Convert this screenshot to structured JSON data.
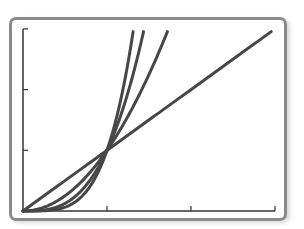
{
  "chart_data": {
    "type": "line",
    "title": "",
    "xlabel": "",
    "ylabel": "",
    "xlim": [
      0,
      3
    ],
    "ylim": [
      0,
      3
    ],
    "xticks": [
      0,
      1,
      2,
      3
    ],
    "yticks": [
      0,
      1,
      2,
      3
    ],
    "tick_labels_shown": false,
    "grid": false,
    "legend": null,
    "series": [
      {
        "name": "y = x",
        "exponent": 1
      },
      {
        "name": "y = x^2",
        "exponent": 2
      },
      {
        "name": "y = x^3",
        "exponent": 3
      },
      {
        "name": "y = x^4",
        "exponent": 4
      }
    ],
    "annotations": [
      "All curves intersect at (1, 1)"
    ]
  },
  "style": {
    "line_color": "#474747",
    "axis_color": "#333333",
    "frame_color": "#8a8a8a"
  },
  "layout": {
    "origin_px": [
      23,
      211
    ],
    "x_unit_px": 84,
    "y_unit_px": 60.7
  }
}
